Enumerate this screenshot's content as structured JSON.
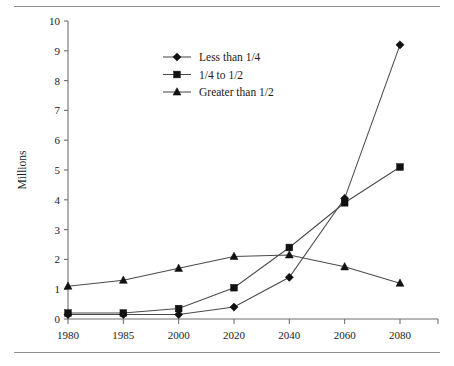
{
  "chart_data": {
    "type": "line",
    "title": "",
    "xlabel": "",
    "ylabel": "Millions",
    "categories": [
      "1980",
      "1985",
      "2000",
      "2020",
      "2040",
      "2060",
      "2080"
    ],
    "ylim": [
      0,
      10
    ],
    "yticks": [
      "0",
      "1",
      "2",
      "3",
      "4",
      "5",
      "6",
      "7",
      "8",
      "9",
      "10"
    ],
    "grid": false,
    "legend_position": "upper-center-left",
    "series": [
      {
        "name": "Less than 1/4",
        "marker": "diamond",
        "values": [
          0.15,
          0.15,
          0.15,
          0.4,
          1.4,
          4.05,
          9.2
        ]
      },
      {
        "name": "1/4 to 1/2",
        "marker": "square",
        "values": [
          0.2,
          0.2,
          0.35,
          1.05,
          2.4,
          3.9,
          5.1
        ]
      },
      {
        "name": "Greater than 1/2",
        "marker": "triangle",
        "values": [
          1.1,
          1.3,
          1.7,
          2.1,
          2.15,
          1.75,
          1.2
        ]
      }
    ]
  },
  "axes": {
    "y_title": "Millions"
  },
  "legend": {
    "entries": [
      {
        "label": "Less than 1/4",
        "marker": "diamond-marker-icon"
      },
      {
        "label": "1/4 to 1/2",
        "marker": "square-marker-icon"
      },
      {
        "label": "Greater than 1/2",
        "marker": "triangle-marker-icon"
      }
    ]
  },
  "colors": {
    "line": "#4a4a4a",
    "marker": "#111111",
    "axis": "#6f6f6f",
    "rule": "#8d8d8d",
    "text": "#1a1a1a",
    "background": "#ffffff"
  }
}
